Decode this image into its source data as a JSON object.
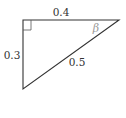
{
  "diagram": {
    "type": "right-triangle",
    "labels": {
      "top_side": "0.4",
      "left_side": "0.3",
      "hypotenuse": "0.5",
      "angle": "β"
    },
    "colors": {
      "stroke": "#333333",
      "angle_label": "#9a9a9a",
      "background": "#ffffff"
    }
  }
}
